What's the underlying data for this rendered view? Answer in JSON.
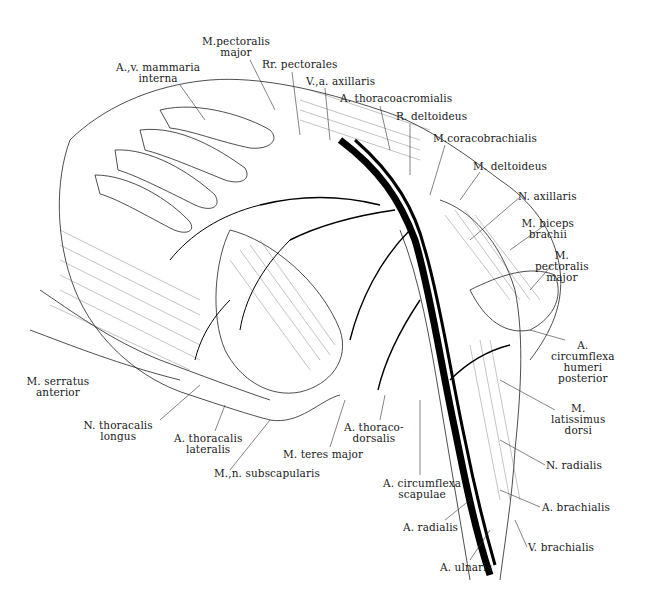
{
  "figure": {
    "rib_labels": [
      "Costa II",
      "III",
      "IV",
      "1",
      "2",
      "2",
      "3",
      "*",
      "*",
      "*"
    ]
  },
  "labels": [
    {
      "id": "m-pectoralis-major-top",
      "lines": [
        "M.pectoralis",
        "major"
      ],
      "x": 236,
      "y": 36,
      "align": "c"
    },
    {
      "id": "av-mammaria-interna",
      "lines": [
        "A.,v. mammaria",
        "interna"
      ],
      "x": 158,
      "y": 62,
      "align": "c"
    },
    {
      "id": "rr-pectorales",
      "lines": [
        "Rr. pectorales"
      ],
      "x": 262,
      "y": 59,
      "align": "l"
    },
    {
      "id": "va-axillaris",
      "lines": [
        "V.,a. axillaris"
      ],
      "x": 306,
      "y": 76,
      "align": "l"
    },
    {
      "id": "a-thoracoacromialis",
      "lines": [
        "A. thoracoacromialis"
      ],
      "x": 340,
      "y": 93,
      "align": "l"
    },
    {
      "id": "r-deltoideus",
      "lines": [
        "R. deltoideus"
      ],
      "x": 396,
      "y": 111,
      "align": "l"
    },
    {
      "id": "m-coracobrachialis",
      "lines": [
        "M.coracobrachialis"
      ],
      "x": 433,
      "y": 133,
      "align": "l"
    },
    {
      "id": "m-deltoideus",
      "lines": [
        "M. deltoideus"
      ],
      "x": 473,
      "y": 161,
      "align": "l"
    },
    {
      "id": "n-axillaris",
      "lines": [
        "N. axillaris"
      ],
      "x": 518,
      "y": 191,
      "align": "l"
    },
    {
      "id": "m-biceps-brachii",
      "lines": [
        "M. biceps",
        "brachii"
      ],
      "x": 548,
      "y": 218,
      "align": "c"
    },
    {
      "id": "m-pectoralis-major-right",
      "lines": [
        "M.",
        "pectoralis",
        "major"
      ],
      "x": 562,
      "y": 250,
      "align": "c"
    },
    {
      "id": "a-circumflexa-humeri-posterior",
      "lines": [
        "A.",
        "circumflexa",
        "humeri",
        "posterior"
      ],
      "x": 583,
      "y": 340,
      "align": "c"
    },
    {
      "id": "m-latissimus-dorsi",
      "lines": [
        "M.",
        "latissimus",
        "dorsi"
      ],
      "x": 578,
      "y": 403,
      "align": "c"
    },
    {
      "id": "n-radialis",
      "lines": [
        "N. radialis"
      ],
      "x": 546,
      "y": 460,
      "align": "l"
    },
    {
      "id": "a-brachialis",
      "lines": [
        "A. brachialis"
      ],
      "x": 542,
      "y": 502,
      "align": "l"
    },
    {
      "id": "v-brachialis",
      "lines": [
        "V. brachialis"
      ],
      "x": 528,
      "y": 542,
      "align": "l"
    },
    {
      "id": "a-ulnaris",
      "lines": [
        "A. ulnaris"
      ],
      "x": 440,
      "y": 562,
      "align": "l"
    },
    {
      "id": "a-radialis",
      "lines": [
        "A. radialis"
      ],
      "x": 403,
      "y": 522,
      "align": "l"
    },
    {
      "id": "a-circumflexa-scapulae",
      "lines": [
        "A. circumflexa",
        "scapulae"
      ],
      "x": 422,
      "y": 478,
      "align": "c"
    },
    {
      "id": "a-thoracodorsalis",
      "lines": [
        "A. thoraco-",
        "dorsalis"
      ],
      "x": 374,
      "y": 422,
      "align": "c"
    },
    {
      "id": "m-teres-major",
      "lines": [
        "M. teres major"
      ],
      "x": 283,
      "y": 449,
      "align": "l"
    },
    {
      "id": "m-n-subscapularis",
      "lines": [
        "M.,n. subscapularis"
      ],
      "x": 214,
      "y": 468,
      "align": "l"
    },
    {
      "id": "a-thoracalis-lateralis",
      "lines": [
        "A. thoracalis",
        "lateralis"
      ],
      "x": 208,
      "y": 433,
      "align": "c"
    },
    {
      "id": "n-thoracalis-longus",
      "lines": [
        "N. thoracalis",
        "longus"
      ],
      "x": 118,
      "y": 420,
      "align": "c"
    },
    {
      "id": "m-serratus-anterior",
      "lines": [
        "M. serratus",
        "anterior"
      ],
      "x": 58,
      "y": 376,
      "align": "c"
    }
  ]
}
